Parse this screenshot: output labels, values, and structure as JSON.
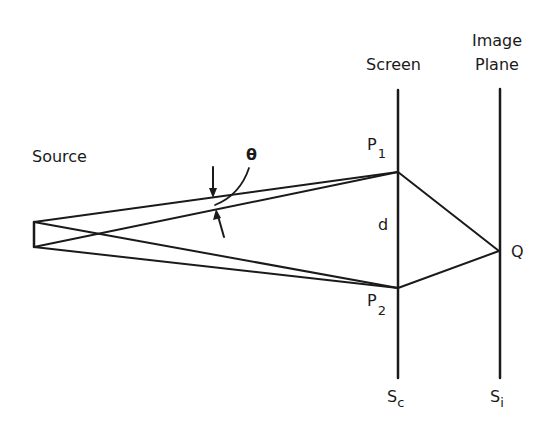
{
  "labels": {
    "source": "Source",
    "theta": "θ",
    "screen": "Screen",
    "image_plane_line1": "Image",
    "image_plane_line2": "Plane",
    "p1_main": "P",
    "p1_sub": "1",
    "p2_main": "P",
    "p2_sub": "2",
    "d": "d",
    "q": "Q",
    "sc_main": "S",
    "sc_sub": "c",
    "si_main": "S",
    "si_sub": "i"
  },
  "geometry": {
    "source_top": [
      34,
      222
    ],
    "source_bottom": [
      34,
      247
    ],
    "p1": [
      398,
      172
    ],
    "p2": [
      398,
      288
    ],
    "q": [
      499,
      251
    ],
    "screen_x": 398,
    "screen_y_range": [
      90,
      378
    ],
    "image_plane_x": 500,
    "image_plane_y_range": [
      89,
      378
    ]
  },
  "colors": {
    "stroke": "#1a1a1a",
    "background": "#ffffff"
  }
}
